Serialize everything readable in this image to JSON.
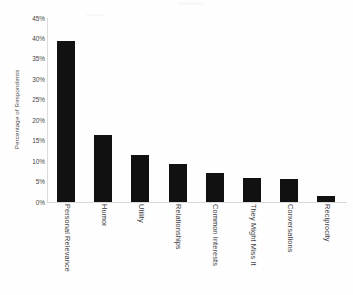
{
  "chart_data": {
    "type": "bar",
    "title": "",
    "subtitle": "",
    "xlabel": "",
    "ylabel": "Percentage of Respondents",
    "ylim": [
      0,
      45
    ],
    "grid": false,
    "legend": false,
    "legend_position": "none",
    "orientation": "vertical",
    "bar_color": "#111111",
    "axis_color": "#dcdcdc",
    "background_color": "#fefefe",
    "y_tick_labels": [
      "45%",
      "40%",
      "35%",
      "30%",
      "25%",
      "20%",
      "15%",
      "10%",
      "5%",
      "0%"
    ],
    "y_tick_values": [
      45,
      40,
      35,
      30,
      25,
      20,
      15,
      10,
      5,
      0
    ],
    "categories": [
      "Personal Relevance",
      "Humor",
      "Utility",
      "Relationships",
      "Common Interests",
      "They Might Miss It",
      "Conversations",
      "Reciprocity"
    ],
    "values": [
      39.5,
      16.5,
      11.6,
      9.2,
      7.2,
      5.9,
      5.6,
      1.5
    ],
    "value_unit": "%"
  }
}
